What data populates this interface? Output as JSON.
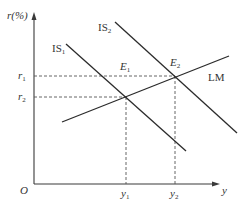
{
  "diagram": {
    "type": "IS-LM model",
    "axes": {
      "y_axis_label": "r(%)",
      "x_axis_label": "y",
      "origin_label": "O"
    },
    "curves": [
      {
        "name": "IS1",
        "label_main": "IS",
        "label_sub": "1"
      },
      {
        "name": "IS2",
        "label_main": "IS",
        "label_sub": "2"
      },
      {
        "name": "LM",
        "label_main": "LM",
        "label_sub": ""
      }
    ],
    "equilibria": [
      {
        "name": "E1",
        "label_main": "E",
        "label_sub": "1",
        "interest_rate": "r2",
        "output": "y1"
      },
      {
        "name": "E2",
        "label_main": "E",
        "label_sub": "2",
        "interest_rate": "r1",
        "output": "y2"
      }
    ],
    "y_ticks": [
      {
        "label_main": "r",
        "label_sub": "1"
      },
      {
        "label_main": "r",
        "label_sub": "2"
      }
    ],
    "x_ticks": [
      {
        "label_main": "y",
        "label_sub": "1"
      },
      {
        "label_main": "y",
        "label_sub": "2"
      }
    ],
    "colors": {
      "line": "#2b2b2b",
      "text": "#333333",
      "background": "#ffffff"
    }
  }
}
